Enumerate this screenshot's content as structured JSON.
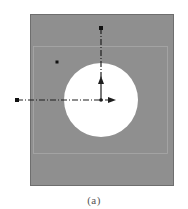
{
  "figure": {
    "caption": "(a)",
    "colors": {
      "background": "#ffffff",
      "panel_fill": "#8f8f8f",
      "panel_border": "#6e6e6e",
      "inner_rect_stroke": "#a6a6a6",
      "hole_fill": "#ffffff",
      "axis_stroke": "#1e1e1e",
      "marker_fill": "#111111"
    },
    "panel": {
      "x": 30,
      "y": 14,
      "width": 143,
      "height": 171
    },
    "inner_rect": {
      "x": 33,
      "y": 46,
      "width": 134,
      "height": 107
    },
    "hole": {
      "cx": 101,
      "cy": 100,
      "r": 37
    },
    "vertical_axis": {
      "x": 101,
      "y_start": 28,
      "y_end": 100,
      "arrow_tip_y": 78
    },
    "horizontal_axis": {
      "y": 100,
      "x_start": 17,
      "x_end": 116
    },
    "point_marker": {
      "x": 57,
      "y": 62
    }
  }
}
